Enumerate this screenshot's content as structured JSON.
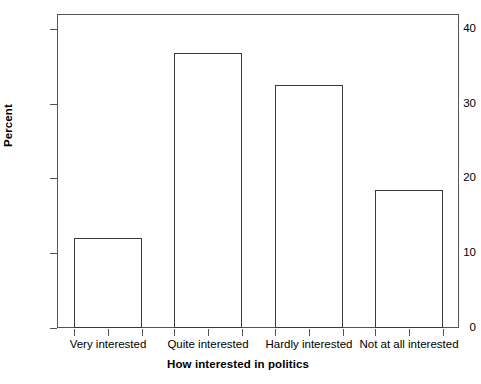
{
  "chart_data": {
    "type": "bar",
    "title": "",
    "xlabel": "How interested in politics",
    "ylabel": "Percent",
    "categories": [
      "Very interested",
      "Quite interested",
      "Hardly interested",
      "Not at all interested"
    ],
    "values": [
      12.0,
      36.8,
      32.5,
      18.4
    ],
    "ylim": [
      0,
      42
    ],
    "yticks": [
      0,
      10,
      20,
      30,
      40
    ],
    "ytick_labels": [
      "0",
      "10",
      "20",
      "30",
      "40"
    ],
    "grid": false,
    "legend": false,
    "bar_fill": "#ffffff",
    "bar_edge": "#3a3a3a",
    "axis_color": "#555555"
  }
}
